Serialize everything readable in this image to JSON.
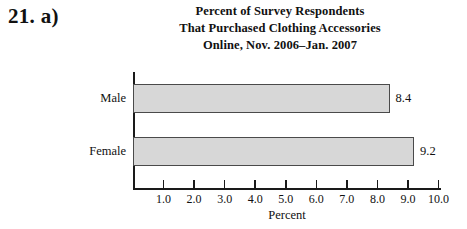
{
  "exercise": {
    "number_label": "21. a)"
  },
  "chart_data": {
    "type": "bar",
    "orientation": "horizontal",
    "title": "Percent of Survey Respondents That Purchased Clothing Accessories Online, Nov. 2006–Jan. 2007",
    "title_lines": [
      "Percent of Survey Respondents",
      "That Purchased Clothing Accessories",
      "Online, Nov. 2006–Jan. 2007"
    ],
    "categories": [
      "Male",
      "Female"
    ],
    "values": [
      8.4,
      9.2
    ],
    "value_labels": [
      "8.4",
      "9.2"
    ],
    "xlabel": "Percent",
    "ylabel": "",
    "xlim": [
      0.0,
      10.0
    ],
    "tick_labels": [
      "1.0",
      "2.0",
      "3.0",
      "4.0",
      "5.0",
      "6.0",
      "7.0",
      "8.0",
      "9.0",
      "10.0"
    ],
    "tick_values": [
      1.0,
      2.0,
      3.0,
      4.0,
      5.0,
      6.0,
      7.0,
      8.0,
      9.0,
      10.0
    ],
    "grid": false,
    "legend": null,
    "bar_fill_color": "#d7d7d7",
    "bar_border_color": "#4a4a4a",
    "axis_color": "#1a1a1a",
    "background_color": "#ffffff"
  }
}
